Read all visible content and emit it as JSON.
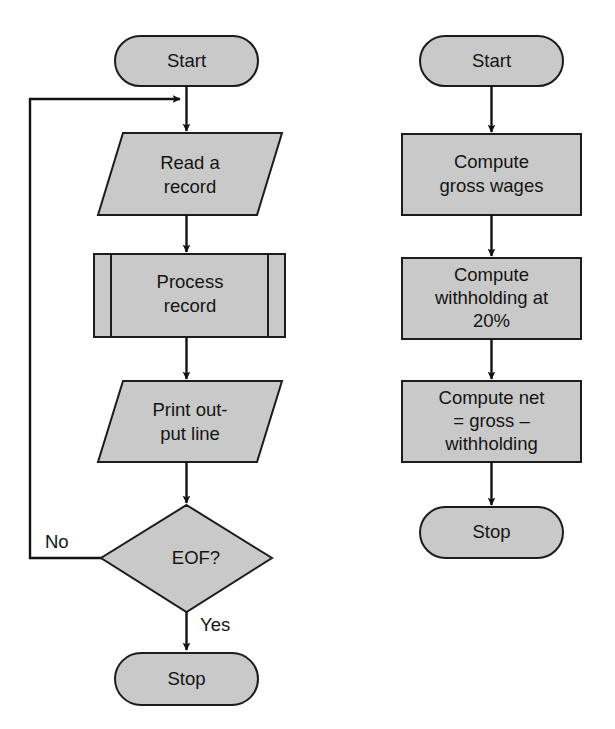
{
  "figure": {
    "type": "flowchart",
    "background_color": "#ffffff",
    "shape_fill": "#c9c9c9",
    "shape_stroke": "#1c1c1c",
    "text_color": "#141414"
  },
  "flowcharts": [
    {
      "id": "record-processing-loop",
      "nodes": {
        "start": {
          "shape": "terminator",
          "label": "Start"
        },
        "read": {
          "shape": "input-output",
          "line1": "Read a",
          "line2": "record"
        },
        "process": {
          "shape": "predefined-process",
          "line1": "Process",
          "line2": "record"
        },
        "print": {
          "shape": "input-output",
          "line1": "Print out-",
          "line2": "put line"
        },
        "decision": {
          "shape": "decision",
          "label": "EOF?"
        },
        "stop": {
          "shape": "terminator",
          "label": "Stop"
        }
      },
      "edge_labels": {
        "no": "No",
        "yes": "Yes"
      }
    },
    {
      "id": "payroll-computation",
      "nodes": {
        "start": {
          "shape": "terminator",
          "label": "Start"
        },
        "gross": {
          "shape": "process",
          "line1": "Compute",
          "line2": "gross wages"
        },
        "withholding": {
          "shape": "process",
          "line1": "Compute",
          "line2": "withholding at",
          "line3": "20%"
        },
        "net": {
          "shape": "process",
          "line1": "Compute net",
          "line2": "= gross –",
          "line3": "withholding"
        },
        "stop": {
          "shape": "terminator",
          "label": "Stop"
        }
      }
    }
  ]
}
